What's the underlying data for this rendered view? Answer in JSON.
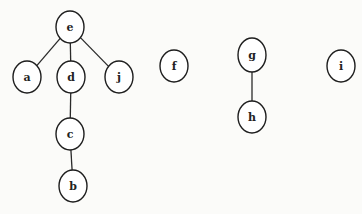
{
  "diagram": {
    "type": "forest",
    "nodes": [
      {
        "id": "e",
        "label": "e",
        "cx": 70,
        "cy": 27,
        "rx": 14,
        "ry": 16
      },
      {
        "id": "a",
        "label": "a",
        "cx": 27,
        "cy": 77,
        "rx": 14,
        "ry": 16
      },
      {
        "id": "d",
        "label": "d",
        "cx": 71,
        "cy": 77,
        "rx": 14,
        "ry": 16
      },
      {
        "id": "j",
        "label": "j",
        "cx": 119,
        "cy": 77,
        "rx": 14,
        "ry": 16
      },
      {
        "id": "c",
        "label": "c",
        "cx": 70,
        "cy": 134,
        "rx": 14,
        "ry": 16
      },
      {
        "id": "b",
        "label": "b",
        "cx": 73,
        "cy": 186,
        "rx": 14,
        "ry": 16
      },
      {
        "id": "f",
        "label": "f",
        "cx": 174,
        "cy": 66,
        "rx": 14,
        "ry": 16
      },
      {
        "id": "g",
        "label": "g",
        "cx": 252,
        "cy": 55,
        "rx": 14,
        "ry": 17
      },
      {
        "id": "h",
        "label": "h",
        "cx": 252,
        "cy": 117,
        "rx": 14,
        "ry": 16
      },
      {
        "id": "i",
        "label": "i",
        "cx": 341,
        "cy": 66,
        "rx": 14,
        "ry": 16
      }
    ],
    "edges": [
      {
        "from": "e",
        "to": "a"
      },
      {
        "from": "e",
        "to": "d"
      },
      {
        "from": "e",
        "to": "j"
      },
      {
        "from": "d",
        "to": "c"
      },
      {
        "from": "c",
        "to": "b"
      },
      {
        "from": "g",
        "to": "h"
      }
    ]
  }
}
